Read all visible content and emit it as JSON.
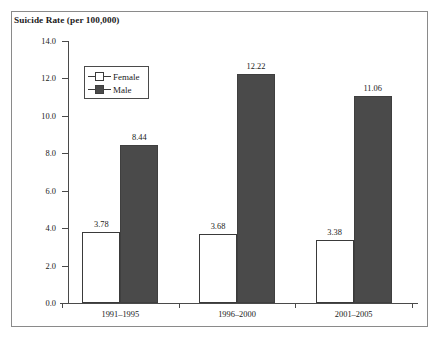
{
  "chart_data": {
    "type": "bar",
    "title": "Suicide Rate (per 100,000)",
    "xlabel": "",
    "ylabel": "",
    "ylim": [
      0.0,
      14.0
    ],
    "ytick_step": 2.0,
    "yticks": [
      "14.0",
      "12.0",
      "10.0",
      "8.0",
      "6.0",
      "4.0",
      "2.0",
      "0.0"
    ],
    "ytick_values": [
      14.0,
      12.0,
      10.0,
      8.0,
      6.0,
      4.0,
      2.0,
      0.0
    ],
    "grid": false,
    "legend_position": "upper-left-inside",
    "categories": [
      "1991–1995",
      "1996–2000",
      "2001–2005"
    ],
    "series": [
      {
        "name": "Female",
        "color": "#ffffff",
        "edge_color": "#3a3a3a",
        "values": [
          3.78,
          3.68,
          3.38
        ],
        "labels": [
          "3.78",
          "3.68",
          "3.38"
        ]
      },
      {
        "name": "Male",
        "color": "#4a4a4a",
        "edge_color": "#3f3f3f",
        "values": [
          8.44,
          12.22,
          11.06
        ],
        "labels": [
          "8.44",
          "12.22",
          "11.06"
        ]
      }
    ]
  },
  "legend": {
    "entries": [
      {
        "label": "Female"
      },
      {
        "label": "Male"
      }
    ]
  },
  "colors": {
    "male_bar": "#4a4a4a",
    "female_bar": "#ffffff",
    "axis": "#4a4a4a",
    "frame": "#8a8a8a",
    "text": "#1a1a1a",
    "background": "#ffffff"
  }
}
